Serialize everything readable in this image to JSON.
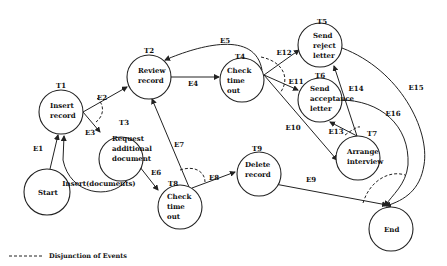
{
  "diagram": {
    "nodes": [
      {
        "id": "T1",
        "tag": "T1",
        "lines": [
          "Insert",
          "record"
        ]
      },
      {
        "id": "T2",
        "tag": "T2",
        "lines": [
          "Review",
          "record"
        ]
      },
      {
        "id": "T3",
        "tag": "T3",
        "lines": [
          "Request",
          "additional",
          "document"
        ]
      },
      {
        "id": "T4",
        "tag": "T4",
        "lines": [
          "Check",
          "time",
          "out"
        ]
      },
      {
        "id": "T5",
        "tag": "T5",
        "lines": [
          "Send",
          "reject",
          "letter"
        ]
      },
      {
        "id": "T6",
        "tag": "T6",
        "lines": [
          "Send",
          "acceptance",
          "letter"
        ]
      },
      {
        "id": "T7",
        "tag": "T7",
        "lines": [
          "Arrange",
          "interview"
        ]
      },
      {
        "id": "T8",
        "tag": "T8",
        "lines": [
          "Check",
          "time",
          "out"
        ]
      },
      {
        "id": "T9",
        "tag": "T9",
        "lines": [
          "Delete",
          "record"
        ]
      },
      {
        "id": "Start",
        "tag": "",
        "lines": [
          "Start"
        ]
      },
      {
        "id": "End",
        "tag": "",
        "lines": [
          "End"
        ]
      }
    ],
    "edges": [
      {
        "label": "E1",
        "from": "Start",
        "to": "T1"
      },
      {
        "label": "E2",
        "from": "T1",
        "to": "T2"
      },
      {
        "label": "E3",
        "from": "T1",
        "to": "T3"
      },
      {
        "label": "E4",
        "from": "T2",
        "to": "T4"
      },
      {
        "label": "E5",
        "from": "T4",
        "to": "T2"
      },
      {
        "label": "E6",
        "from": "T3",
        "to": "T8"
      },
      {
        "label": "E7",
        "from": "T8",
        "to": "T2"
      },
      {
        "label": "E8",
        "from": "T8",
        "to": "T9"
      },
      {
        "label": "E9",
        "from": "T9",
        "to": "End"
      },
      {
        "label": "E10",
        "from": "T4",
        "to": "T7"
      },
      {
        "label": "E11",
        "from": "T4",
        "to": "T6"
      },
      {
        "label": "E12",
        "from": "T4",
        "to": "T5"
      },
      {
        "label": "E13",
        "from": "T7",
        "to": "T6"
      },
      {
        "label": "E14",
        "from": "T7",
        "to": "T5"
      },
      {
        "label": "E15",
        "from": "T5",
        "to": "End"
      },
      {
        "label": "E16",
        "from": "T6",
        "to": "End"
      },
      {
        "label": "Insert(documents)",
        "from": "T3",
        "to": "T1"
      }
    ],
    "legend": {
      "line_style": "dashed",
      "label": "Disjunction of Events"
    }
  }
}
